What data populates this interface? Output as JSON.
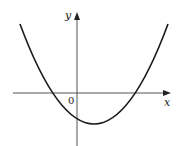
{
  "figure": {
    "type": "function-graph",
    "labels": {
      "y_axis": "y",
      "x_axis": "x",
      "origin": "0"
    },
    "colors": {
      "curve": "#1a1a1a",
      "axes": "#555555",
      "background": "#ffffff"
    },
    "curve": {
      "shape": "parabola",
      "opens": "up",
      "roots": [
        "negative",
        "positive"
      ],
      "vertex_side": "right of y-axis, below x-axis",
      "y_intercept": "negative"
    }
  }
}
